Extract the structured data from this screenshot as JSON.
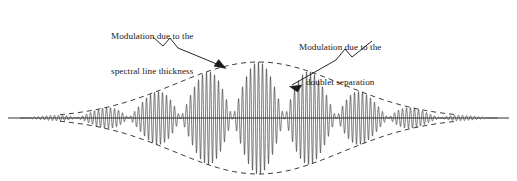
{
  "figure": {
    "background_color": "#ffffff",
    "ink_color": "#1a1a1a",
    "width": 517,
    "height": 181
  },
  "annotations": [
    {
      "id": "spectral-line-thickness",
      "line1": "Modulation due to the",
      "line2": "spectral line thickness",
      "leader": "zigzag-arrow pointing down-right to upper dashed envelope"
    },
    {
      "id": "doublet-separation",
      "line1": "Modulation due to the",
      "line2": "doublet separation",
      "leader": "zigzag-arrow pointing down-left to beat packet edge"
    }
  ],
  "chart_data": {
    "type": "line",
    "title": "",
    "subtitle": "",
    "xlabel": "",
    "ylabel": "",
    "grid": false,
    "legend": "none",
    "axis_line_y": 118,
    "xlim": [
      0,
      517
    ],
    "ylim": [
      -1.05,
      1.05
    ],
    "model": {
      "expression": "y(x) = A * exp(-((x - x0)/sigma)^2) * cos(pi*(x - x0)/beat_halfperiod) * cos(2*pi*(x - x0)/carrier_period)",
      "x0": 258.5,
      "amplitude_px": 56,
      "sigma_px": 118,
      "carrier_period_px": 4.0,
      "beat_halfperiod_px": 52.0,
      "wave_start_px": 20,
      "wave_end_px": 498
    },
    "envelope": {
      "kind": "gaussian",
      "style": "dashed",
      "dash_pattern": [
        5,
        4
      ],
      "peak_upper_y": 62,
      "peak_lower_y": 174,
      "center_x": 258.5,
      "visible_from_px": 60,
      "visible_to_px": 458
    },
    "beat_nodes_px": [
      51,
      103,
      155,
      207,
      259,
      311,
      363,
      415,
      467
    ],
    "beat_antinodes_px": [
      77,
      129,
      181,
      233,
      285,
      337,
      389,
      441
    ],
    "series": [
      {
        "name": "interferogram",
        "x": [
          20,
          40,
          60,
          80,
          100,
          120,
          140,
          155,
          160,
          181,
          207,
          233,
          259,
          285,
          311,
          337,
          363,
          389,
          415,
          441,
          467,
          490,
          498
        ],
        "envelope_amplitude": [
          1.5,
          3.5,
          7.0,
          13.0,
          21.0,
          30.5,
          40.0,
          45.0,
          46.0,
          51.0,
          54.0,
          55.5,
          56.0,
          55.5,
          54.0,
          51.0,
          46.0,
          40.0,
          30.5,
          21.0,
          10.0,
          3.0,
          1.5
        ],
        "beat_factor": [
          0,
          0.7,
          0,
          -0.9,
          0,
          1,
          0,
          0,
          0.2,
          1,
          0,
          -1,
          0,
          1,
          0,
          -1,
          0,
          1,
          0,
          -1,
          0,
          0.5,
          0
        ]
      }
    ]
  }
}
